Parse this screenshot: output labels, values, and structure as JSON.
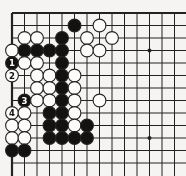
{
  "diagram": {
    "type": "go-board-corner",
    "board": {
      "visible_cols": 14,
      "visible_rows": 13,
      "origin_x": 12,
      "origin_y": 13,
      "cell": 12.5,
      "stone_radius": 6.4,
      "cropped_right": true,
      "cropped_bottom": true
    },
    "colors": {
      "paper": "#f5f4f2",
      "line": "#222222",
      "black_stone": "#141210",
      "white_stone": "#fcfbfa",
      "black_label_text": "#ffffff",
      "white_label_text": "#111111"
    },
    "star_points": [
      {
        "col": 12,
        "row": 4
      },
      {
        "col": 12,
        "row": 11
      }
    ],
    "move_labels": [
      "1",
      "2",
      "3",
      "4"
    ],
    "stones": [
      {
        "col": 6,
        "row": 2,
        "color": "black"
      },
      {
        "col": 8,
        "row": 2,
        "color": "white"
      },
      {
        "col": 2,
        "row": 3,
        "color": "white"
      },
      {
        "col": 3,
        "row": 3,
        "color": "white"
      },
      {
        "col": 5,
        "row": 3,
        "color": "black"
      },
      {
        "col": 7,
        "row": 3,
        "color": "white"
      },
      {
        "col": 9,
        "row": 3,
        "color": "white"
      },
      {
        "col": 1,
        "row": 4,
        "color": "white"
      },
      {
        "col": 2,
        "row": 4,
        "color": "black"
      },
      {
        "col": 3,
        "row": 4,
        "color": "black"
      },
      {
        "col": 4,
        "row": 4,
        "color": "black"
      },
      {
        "col": 5,
        "row": 4,
        "color": "black"
      },
      {
        "col": 7,
        "row": 4,
        "color": "white"
      },
      {
        "col": 8,
        "row": 4,
        "color": "white"
      },
      {
        "col": 1,
        "row": 5,
        "color": "black",
        "label": "1"
      },
      {
        "col": 2,
        "row": 5,
        "color": "white"
      },
      {
        "col": 3,
        "row": 5,
        "color": "white"
      },
      {
        "col": 5,
        "row": 5,
        "color": "black"
      },
      {
        "col": 1,
        "row": 6,
        "color": "white",
        "label": "2"
      },
      {
        "col": 3,
        "row": 6,
        "color": "white"
      },
      {
        "col": 4,
        "row": 6,
        "color": "white"
      },
      {
        "col": 5,
        "row": 6,
        "color": "black"
      },
      {
        "col": 6,
        "row": 6,
        "color": "white"
      },
      {
        "col": 3,
        "row": 7,
        "color": "white"
      },
      {
        "col": 4,
        "row": 7,
        "color": "white"
      },
      {
        "col": 5,
        "row": 7,
        "color": "black"
      },
      {
        "col": 6,
        "row": 7,
        "color": "white"
      },
      {
        "col": 2,
        "row": 8,
        "color": "black",
        "label": "3"
      },
      {
        "col": 3,
        "row": 8,
        "color": "white"
      },
      {
        "col": 4,
        "row": 8,
        "color": "white"
      },
      {
        "col": 5,
        "row": 8,
        "color": "black"
      },
      {
        "col": 6,
        "row": 8,
        "color": "white"
      },
      {
        "col": 8,
        "row": 8,
        "color": "white"
      },
      {
        "col": 1,
        "row": 9,
        "color": "white",
        "label": "4"
      },
      {
        "col": 2,
        "row": 9,
        "color": "white"
      },
      {
        "col": 4,
        "row": 9,
        "color": "black"
      },
      {
        "col": 5,
        "row": 9,
        "color": "black"
      },
      {
        "col": 6,
        "row": 9,
        "color": "white"
      },
      {
        "col": 1,
        "row": 10,
        "color": "white"
      },
      {
        "col": 2,
        "row": 10,
        "color": "white"
      },
      {
        "col": 4,
        "row": 10,
        "color": "black"
      },
      {
        "col": 5,
        "row": 10,
        "color": "black"
      },
      {
        "col": 6,
        "row": 10,
        "color": "white"
      },
      {
        "col": 7,
        "row": 10,
        "color": "black"
      },
      {
        "col": 1,
        "row": 11,
        "color": "white"
      },
      {
        "col": 2,
        "row": 11,
        "color": "white"
      },
      {
        "col": 4,
        "row": 11,
        "color": "black"
      },
      {
        "col": 5,
        "row": 11,
        "color": "black"
      },
      {
        "col": 6,
        "row": 11,
        "color": "black"
      },
      {
        "col": 7,
        "row": 11,
        "color": "black"
      },
      {
        "col": 1,
        "row": 12,
        "color": "black"
      },
      {
        "col": 2,
        "row": 12,
        "color": "black"
      }
    ]
  }
}
